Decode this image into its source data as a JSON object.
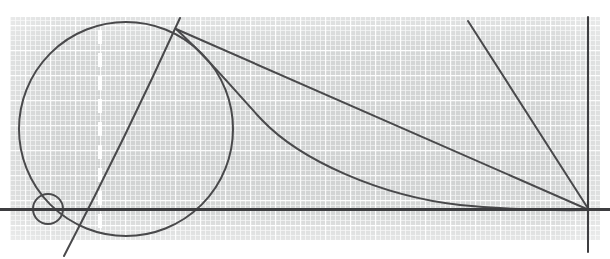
{
  "canvas": {
    "width": 610,
    "height": 259,
    "background": "#ffffff"
  },
  "figure": {
    "medium": "scanned quadrille graph paper photograph",
    "paper": {
      "name": "graph-paper-sheet",
      "x": 10,
      "y": 17,
      "width": 590,
      "height": 223,
      "tint": "#d4d6d6",
      "minor_grid_color": "#ffffff",
      "minor_grid_spacing": 5,
      "major_grid_color": "#ffffff",
      "major_grid_spacing": 25
    },
    "ink_color": "#4a4a4c",
    "ink_color_dark": "#3d3d40",
    "shapes": [
      {
        "name": "large-circle",
        "type": "circle",
        "cx": 126,
        "cy": 129,
        "r": 107,
        "stroke_width": 2.0
      },
      {
        "name": "small-circle",
        "type": "circle",
        "cx": 48,
        "cy": 209,
        "r": 15,
        "stroke_width": 2.0
      },
      {
        "name": "horizontal-tangent-line",
        "type": "line",
        "x1": 0,
        "y1": 209.5,
        "x2": 610,
        "y2": 209.5,
        "stroke_width": 3.0
      },
      {
        "name": "vertical-line-right",
        "type": "line",
        "x1": 588,
        "y1": 17,
        "x2": 588,
        "y2": 252,
        "stroke_width": 2.0
      },
      {
        "name": "diagonal-line-apex-to-vertex",
        "type": "line",
        "x1": 176,
        "y1": 29,
        "x2": 589,
        "y2": 210,
        "stroke_width": 2.0
      },
      {
        "name": "steep-diagonal-line-through-small-circle",
        "type": "line",
        "x1": 180,
        "y1": 18,
        "x2": 64,
        "y2": 256,
        "stroke_width": 2.0
      },
      {
        "name": "diagonal-line-upper-right-to-vertex",
        "type": "line",
        "x1": 468,
        "y1": 21,
        "x2": 589,
        "y2": 210,
        "stroke_width": 2.0
      },
      {
        "name": "asymptotic-curve",
        "type": "curve",
        "start": [
          176,
          29
        ],
        "end": [
          589,
          210
        ],
        "stroke_width": 2.0
      },
      {
        "name": "dashed-white-vertical-line",
        "type": "dashed-line",
        "x": 100,
        "y1": 30,
        "y2": 237,
        "color": "#ffffff",
        "stroke_width": 4.0,
        "dash": "14 9"
      }
    ],
    "key_points": [
      {
        "name": "apex-intersection-point",
        "x": 176,
        "y": 29
      },
      {
        "name": "vertex-convergence-point",
        "x": 588,
        "y": 210
      },
      {
        "name": "tangency-point-small-circle",
        "x": 48,
        "y": 209
      },
      {
        "name": "curve-circle-intersection",
        "x": 235,
        "y": 95
      }
    ]
  }
}
